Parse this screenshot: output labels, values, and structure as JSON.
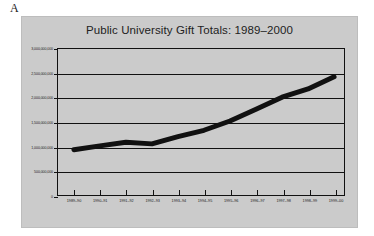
{
  "figure": {
    "label": "A"
  },
  "chart_data": {
    "type": "line",
    "title": "Public University Gift Totals: 1989–2000",
    "xlabel": "",
    "ylabel": "",
    "categories": [
      "1989–90",
      "1990–91",
      "1991–92",
      "1992–93",
      "1993–94",
      "1994–95",
      "1995–96",
      "1996–97",
      "1997–98",
      "1998–99",
      "1999–00"
    ],
    "values": [
      930000000,
      1010000000,
      1085000000,
      1050000000,
      1200000000,
      1330000000,
      1520000000,
      1760000000,
      2010000000,
      2180000000,
      2430000000
    ],
    "ylim": [
      0,
      3000000000
    ],
    "ytick_values": [
      0,
      500000000,
      1000000000,
      1500000000,
      2000000000,
      2500000000,
      3000000000
    ],
    "ytick_labels": [
      "0",
      "500,000,000",
      "1,000,000,000",
      "1,500,000,000",
      "2,000,000,000",
      "2,500,000,000",
      "3,000,000,000"
    ],
    "grid": true,
    "legend": "none",
    "series_color": "#111111",
    "plot_background": "#cbcbcb",
    "panel_background": "#cbcbcb"
  }
}
